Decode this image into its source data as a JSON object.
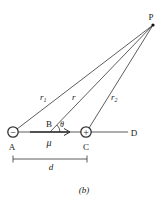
{
  "diagram": {
    "caption": "(b)",
    "point_P": "P",
    "point_A": "A",
    "point_B": "B",
    "point_C": "C",
    "point_D": "D",
    "charge_A_sign": "−",
    "charge_C_sign": "+",
    "r1_label": "r",
    "r1_sub": "1",
    "r_label": "r",
    "r2_label": "r",
    "r2_sub": "2",
    "theta_label": "θ",
    "mu_label": "μ",
    "d_label": "d"
  }
}
